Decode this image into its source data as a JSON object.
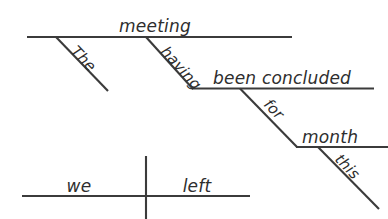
{
  "diagram": {
    "type": "reed-kellogg-sentence-diagram",
    "sentence": "The meeting having been concluded for this month, we left.",
    "background_color": "#ffffff",
    "line_color": "#3b3b3b",
    "text_color": "#2e2e2e",
    "labels": {
      "subject_main": "we",
      "verb_main": "left",
      "absolute_subject": "meeting",
      "absolute_subject_modifier": "The",
      "participle_aux": "having",
      "participle_verb": "been concluded",
      "preposition": "for",
      "prep_object": "month",
      "prep_object_modifier": "this"
    },
    "parts": [
      {
        "name": "absolute-phrase-baseline",
        "words": [
          "meeting"
        ]
      },
      {
        "name": "absolute-modifier-slant",
        "words": [
          "The"
        ]
      },
      {
        "name": "participle-slant",
        "words": [
          "having"
        ]
      },
      {
        "name": "participle-baseline",
        "words": [
          "been concluded"
        ]
      },
      {
        "name": "prepositional-slant",
        "words": [
          "for"
        ]
      },
      {
        "name": "prep-object-baseline",
        "words": [
          "month"
        ]
      },
      {
        "name": "prep-object-modifier-slant",
        "words": [
          "this"
        ]
      },
      {
        "name": "main-clause-baseline",
        "words": [
          "we",
          "left"
        ]
      }
    ]
  }
}
